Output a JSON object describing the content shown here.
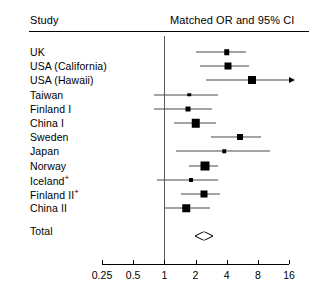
{
  "header": {
    "study_label": "Study",
    "or_label": "Matched OR and 95% CI"
  },
  "chart_data": {
    "type": "forest",
    "title": "Matched OR and 95% CI",
    "xlabel": "",
    "ylabel": "Study",
    "scale": "log2",
    "xlim": [
      0.25,
      16
    ],
    "null_value": 1,
    "grid": false,
    "legend": "none",
    "axis_ticks": [
      {
        "value": 0.25,
        "label": "0.25"
      },
      {
        "value": 0.5,
        "label": "0.5"
      },
      {
        "value": 1,
        "label": "1"
      },
      {
        "value": 2,
        "label": "2"
      },
      {
        "value": 4,
        "label": "4"
      },
      {
        "value": 8,
        "label": "8"
      },
      {
        "value": 16,
        "label": "16"
      }
    ],
    "categories": [
      "UK",
      "USA (California)",
      "USA (Hawaii)",
      "Taiwan",
      "Finland I",
      "China I",
      "Sweden",
      "Japan",
      "Norway",
      "Iceland+",
      "Finland II+",
      "China II",
      "Total"
    ],
    "rows": [
      {
        "label": "UK",
        "sup": "",
        "or": 4.0,
        "lo": 2.0,
        "hi": 6.1,
        "size": 5.5,
        "arrow": false,
        "summary": false
      },
      {
        "label": "USA (California)",
        "sup": "",
        "or": 4.1,
        "lo": 2.2,
        "hi": 6.6,
        "size": 7.0,
        "arrow": false,
        "summary": false
      },
      {
        "label": "USA (Hawaii)",
        "sup": "",
        "or": 7.0,
        "lo": 2.5,
        "hi": 15.3,
        "size": 8.0,
        "arrow": true,
        "summary": false
      },
      {
        "label": "Taiwan",
        "sup": "",
        "or": 1.75,
        "lo": 0.8,
        "hi": 3.3,
        "size": 3.5,
        "arrow": false,
        "summary": false
      },
      {
        "label": "Finland I",
        "sup": "",
        "or": 1.7,
        "lo": 0.8,
        "hi": 2.9,
        "size": 5.0,
        "arrow": false,
        "summary": false
      },
      {
        "label": "China I",
        "sup": "",
        "or": 2.0,
        "lo": 1.25,
        "hi": 3.15,
        "size": 8.5,
        "arrow": false,
        "summary": false
      },
      {
        "label": "Sweden",
        "sup": "",
        "or": 5.4,
        "lo": 2.8,
        "hi": 8.6,
        "size": 6.0,
        "arrow": false,
        "summary": false
      },
      {
        "label": "Japan",
        "sup": "",
        "or": 3.8,
        "lo": 1.3,
        "hi": 10.5,
        "size": 3.5,
        "arrow": false,
        "summary": false
      },
      {
        "label": "Norway",
        "sup": "",
        "or": 2.45,
        "lo": 1.75,
        "hi": 3.3,
        "size": 9.0,
        "arrow": false,
        "summary": false
      },
      {
        "label": "Iceland",
        "sup": "+",
        "or": 1.8,
        "lo": 0.85,
        "hi": 3.3,
        "size": 4.0,
        "arrow": false,
        "summary": false
      },
      {
        "label": "Finland II",
        "sup": "+",
        "or": 2.4,
        "lo": 1.45,
        "hi": 3.45,
        "size": 7.0,
        "arrow": false,
        "summary": false
      },
      {
        "label": "China II",
        "sup": "",
        "or": 1.62,
        "lo": 1.0,
        "hi": 2.75,
        "size": 7.5,
        "arrow": false,
        "summary": false
      },
      {
        "label": "Total",
        "sup": "",
        "or": 2.4,
        "lo": 2.0,
        "hi": 2.9,
        "size": 0,
        "arrow": false,
        "summary": true
      }
    ]
  },
  "layout": {
    "plot_left": 102,
    "plot_right": 289,
    "first_row_y": 52,
    "row_step": 14.2,
    "summary_gap": 9,
    "axis_y": 264,
    "null_top": 36,
    "null_bottom": 264
  },
  "colors": {
    "ink": "#000000",
    "rule": "#000000",
    "ci": "#4a4a4a",
    "null": "#5a5a5a",
    "background": "#ffffff"
  }
}
